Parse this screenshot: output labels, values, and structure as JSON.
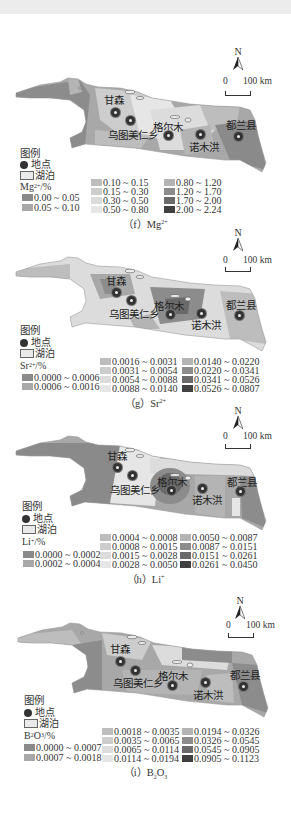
{
  "figure": {
    "legend_heading": "图例",
    "legend_site": "地点",
    "legend_lake": "湖泊",
    "north_label": "N",
    "scale_zero": "0",
    "scale_label": "100 km",
    "places": [
      "甘森",
      "乌图美仁乡",
      "格尔木",
      "诺木洪",
      "都兰县"
    ]
  },
  "panels": [
    {
      "id": "f",
      "caption_prefix": "（f）",
      "caption_species": "Mg",
      "caption_charge": "2+",
      "unit_label_base": "Mg",
      "unit_label_sup": "2+",
      "unit_label_suffix": "/%",
      "classes": [
        {
          "range": "0.00 ~ 0.05",
          "color": "#8a8a8a"
        },
        {
          "range": "0.05 ~ 0.10",
          "color": "#a8a8a8"
        },
        {
          "range": "0.10 ~ 0.15",
          "color": "#bdbdbd"
        },
        {
          "range": "0.15 ~ 0.30",
          "color": "#cdcdcd"
        },
        {
          "range": "0.30 ~ 0.50",
          "color": "#dcdcdc"
        },
        {
          "range": "0.50 ~ 0.80",
          "color": "#e6e6e6"
        },
        {
          "range": "0.80 ~ 1.20",
          "color": "#b4b4b4"
        },
        {
          "range": "1.20 ~ 1.70",
          "color": "#8c8c8c"
        },
        {
          "range": "1.70 ~ 2.00",
          "color": "#6a6a6a"
        },
        {
          "range": "2.00 ~ 2.24",
          "color": "#404040"
        }
      ]
    },
    {
      "id": "g",
      "caption_prefix": "（g）",
      "caption_species": "Sr",
      "caption_charge": "2+",
      "unit_label_base": "Sr",
      "unit_label_sup": "2+",
      "unit_label_suffix": "/%",
      "classes": [
        {
          "range": "0.0000 ~ 0.0006",
          "color": "#8a8a8a"
        },
        {
          "range": "0.0006 ~ 0.0016",
          "color": "#a8a8a8"
        },
        {
          "range": "0.0016 ~ 0.0031",
          "color": "#bdbdbd"
        },
        {
          "range": "0.0031 ~ 0.0054",
          "color": "#cdcdcd"
        },
        {
          "range": "0.0054 ~ 0.0088",
          "color": "#dcdcdc"
        },
        {
          "range": "0.0088 ~ 0.0140",
          "color": "#e6e6e6"
        },
        {
          "range": "0.0140 ~ 0.0220",
          "color": "#b4b4b4"
        },
        {
          "range": "0.0220 ~ 0.0341",
          "color": "#8c8c8c"
        },
        {
          "range": "0.0341 ~ 0.0526",
          "color": "#6a6a6a"
        },
        {
          "range": "0.0526 ~ 0.0807",
          "color": "#404040"
        }
      ]
    },
    {
      "id": "h",
      "caption_prefix": "（h）",
      "caption_species": "Li",
      "caption_charge": "+",
      "unit_label_base": "Li",
      "unit_label_sup": "+",
      "unit_label_suffix": "/%",
      "classes": [
        {
          "range": "0.0000 ~ 0.0002",
          "color": "#8a8a8a"
        },
        {
          "range": "0.0002 ~ 0.0004",
          "color": "#a8a8a8"
        },
        {
          "range": "0.0004 ~ 0.0008",
          "color": "#bdbdbd"
        },
        {
          "range": "0.0008 ~ 0.0015",
          "color": "#cdcdcd"
        },
        {
          "range": "0.0015 ~ 0.0028",
          "color": "#dcdcdc"
        },
        {
          "range": "0.0028 ~ 0.0050",
          "color": "#e6e6e6"
        },
        {
          "range": "0.0050 ~ 0.0087",
          "color": "#b4b4b4"
        },
        {
          "range": "0.0087 ~ 0.0151",
          "color": "#8c8c8c"
        },
        {
          "range": "0.0151 ~ 0.0261",
          "color": "#6a6a6a"
        },
        {
          "range": "0.0261 ~ 0.0450",
          "color": "#404040"
        }
      ]
    },
    {
      "id": "i",
      "caption_prefix": "（i）",
      "caption_species": "B",
      "caption_sub1": "2",
      "caption_species2": "O",
      "caption_sub2": "3",
      "unit_label_base": "B",
      "unit_label_sub1": "2",
      "unit_label_mid": "O",
      "unit_label_sub2": "3",
      "unit_label_suffix": "/%",
      "classes": [
        {
          "range": "0.0000 ~ 0.0007",
          "color": "#8a8a8a"
        },
        {
          "range": "0.0007 ~ 0.0018",
          "color": "#a8a8a8"
        },
        {
          "range": "0.0018 ~ 0.0035",
          "color": "#bdbdbd"
        },
        {
          "range": "0.0035 ~ 0.0065",
          "color": "#cdcdcd"
        },
        {
          "range": "0.0065 ~ 0.0114",
          "color": "#dcdcdc"
        },
        {
          "range": "0.0114 ~ 0.0194",
          "color": "#e6e6e6"
        },
        {
          "range": "0.0194 ~ 0.0326",
          "color": "#b4b4b4"
        },
        {
          "range": "0.0326 ~ 0.0545",
          "color": "#8c8c8c"
        },
        {
          "range": "0.0545 ~ 0.0905",
          "color": "#6a6a6a"
        },
        {
          "range": "0.0905 ~ 0.1123",
          "color": "#404040"
        }
      ]
    }
  ]
}
